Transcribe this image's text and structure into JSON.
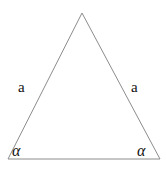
{
  "figure": {
    "type": "geometry-diagram",
    "shape": "isosceles-triangle",
    "background_color": "#ffffff",
    "stroke_color": "#8c8c8c",
    "stroke_width": 1,
    "text_color": "#111111",
    "width": 166,
    "height": 175,
    "vertices": {
      "apex": {
        "x": 82,
        "y": 13
      },
      "bottom_left": {
        "x": 8,
        "y": 159
      },
      "bottom_right": {
        "x": 160,
        "y": 159
      }
    },
    "labels": {
      "side_left": "a",
      "side_right": "a",
      "angle_left": "α",
      "angle_right": "α"
    }
  }
}
